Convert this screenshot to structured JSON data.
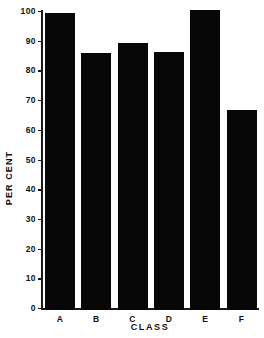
{
  "chart_data": {
    "type": "bar",
    "title": "",
    "xlabel": "CLASS",
    "ylabel": "PER CENT",
    "categories": [
      "A",
      "B",
      "C",
      "D",
      "E",
      "F"
    ],
    "values": [
      100,
      86.5,
      90,
      87,
      101,
      67.5
    ],
    "ylim": [
      0,
      101
    ],
    "yticks": [
      0,
      10,
      20,
      30,
      40,
      50,
      60,
      70,
      80,
      90,
      100
    ],
    "ytick_labels": [
      "0",
      "10",
      "20",
      "30",
      "40",
      "50",
      "60",
      "70",
      "80",
      "90",
      "100"
    ],
    "grid": false,
    "legend": null,
    "bar_color": "#070707",
    "axis_color": "#1a1a1a",
    "background": "#ffffff"
  }
}
